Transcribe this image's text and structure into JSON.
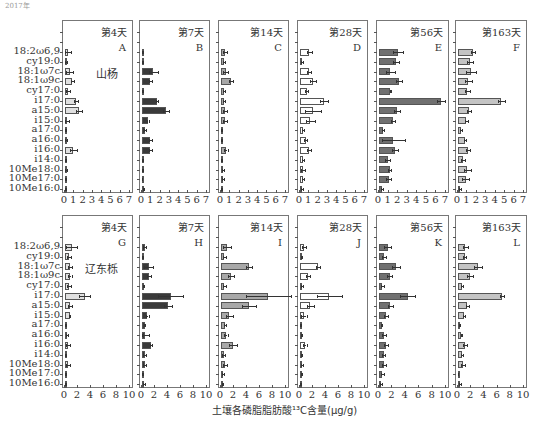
{
  "corner_text": "2017年",
  "chart_data": {
    "type": "bar",
    "orientation": "horizontal",
    "xlabel": "土壤各磷脂脂肪酸¹³C含量(μg/g)",
    "categories": [
      "18:2ω6,9",
      "cy19:0",
      "18:1ω7c",
      "18:1ω9c",
      "cy17:0",
      "i17:0",
      "a15:0",
      "i15:0",
      "a17:0",
      "a16:0",
      "i16:0",
      "i14:0",
      "10Me18:0",
      "10Me17:0",
      "10Me16:0"
    ],
    "rows": [
      {
        "species": "山杨",
        "xlim": [
          0,
          7
        ],
        "xticks": [
          "0",
          "1",
          "2",
          "3",
          "4",
          "5",
          "6",
          "7"
        ],
        "panels": [
          {
            "letter": "A",
            "title": "第4天",
            "color": "#e0e0e0",
            "values": [
              0.3,
              0.1,
              0.5,
              0.8,
              0.3,
              1.2,
              1.5,
              0.2,
              0.1,
              0.1,
              0.9,
              0.05,
              0.1,
              0.05,
              0.1
            ],
            "errors": [
              0.3,
              0.1,
              0.4,
              0.2,
              0.2,
              0.2,
              0.3,
              0.2,
              0.05,
              0.1,
              0.4,
              0.05,
              0.1,
              0.02,
              0.05
            ]
          },
          {
            "letter": "B",
            "title": "第7天",
            "color": "#3a3a3a",
            "values": [
              0.1,
              0.05,
              1.2,
              0.9,
              0.05,
              1.6,
              2.6,
              0.6,
              0.3,
              0.9,
              0.9,
              0.05,
              0.05,
              0.02,
              0.2
            ],
            "errors": [
              0.05,
              0.02,
              0.5,
              0.2,
              0.02,
              0.1,
              0.3,
              0.1,
              0.1,
              0.2,
              0.2,
              0.02,
              0.02,
              0.01,
              0.05
            ]
          },
          {
            "letter": "C",
            "title": "第14天",
            "color": "#a8a8a8",
            "values": [
              0.4,
              0.3,
              0.5,
              1.1,
              0.3,
              0.3,
              0.4,
              0.4,
              0.1,
              0.05,
              0.5,
              0.1,
              0.2,
              0.2,
              0.1
            ],
            "errors": [
              0.2,
              0.1,
              0.3,
              0.2,
              0.1,
              0.1,
              0.2,
              0.2,
              0.05,
              0.05,
              0.2,
              0.05,
              0.1,
              0.1,
              0.05
            ]
          },
          {
            "letter": "D",
            "title": "第28天",
            "color": "#ffffff",
            "values": [
              1.0,
              0.2,
              1.0,
              1.4,
              0.7,
              2.6,
              1.4,
              1.1,
              0.3,
              0.6,
              1.0,
              0.3,
              0.3,
              0.3,
              0.2
            ],
            "errors": [
              0.3,
              0.1,
              0.2,
              0.3,
              0.2,
              0.4,
              0.9,
              0.5,
              0.1,
              0.2,
              0.2,
              0.1,
              0.2,
              0.1,
              0.1
            ]
          },
          {
            "letter": "E",
            "title": "第56天",
            "color": "#707070",
            "values": [
              2.0,
              1.8,
              1.2,
              2.1,
              1.2,
              6.5,
              1.9,
              1.5,
              0.4,
              1.5,
              1.7,
              0.9,
              1.1,
              1.0,
              0.3
            ],
            "errors": [
              0.5,
              0.3,
              0.5,
              0.3,
              0.1,
              0.4,
              0.3,
              0.2,
              0.1,
              1.2,
              0.3,
              0.3,
              0.2,
              0.3,
              0.1
            ]
          },
          {
            "letter": "F",
            "title": "第163天",
            "color": "#c4c4c4",
            "values": [
              1.6,
              1.3,
              1.4,
              1.1,
              1.0,
              4.6,
              1.2,
              0.9,
              0.3,
              0.7,
              1.1,
              0.5,
              1.0,
              0.8,
              0.2
            ],
            "errors": [
              0.2,
              0.3,
              0.5,
              0.4,
              0.3,
              0.4,
              0.2,
              0.2,
              0.1,
              0.1,
              0.2,
              0.2,
              0.4,
              0.4,
              0.1
            ]
          }
        ]
      },
      {
        "species": "辽东栎",
        "xlim": [
          0,
          10
        ],
        "xticks": [
          "0",
          "2",
          "4",
          "6",
          "8",
          "10"
        ],
        "panels": [
          {
            "letter": "G",
            "title": "第4天",
            "color": "#e0e0e0",
            "values": [
              1.0,
              0.6,
              0.8,
              0.7,
              0.6,
              3.0,
              0.8,
              0.7,
              0.05,
              0.3,
              0.5,
              0.1,
              0.5,
              0.1,
              0.1
            ],
            "errors": [
              0.8,
              0.3,
              0.3,
              0.3,
              0.3,
              0.8,
              0.3,
              0.1,
              0.05,
              0.1,
              0.3,
              0.05,
              0.3,
              0.05,
              0.05
            ]
          },
          {
            "letter": "H",
            "title": "第7天",
            "color": "#3a3a3a",
            "values": [
              0.4,
              0.1,
              1.0,
              1.1,
              0.2,
              4.4,
              4.0,
              0.8,
              0.4,
              0.4,
              1.4,
              0.4,
              0.4,
              0.1,
              0.3
            ],
            "errors": [
              0.2,
              0.05,
              0.7,
              0.3,
              0.1,
              1.9,
              0.6,
              0.2,
              0.1,
              0.6,
              0.2,
              0.2,
              0.2,
              0.05,
              0.1
            ]
          },
          {
            "letter": "I",
            "title": "第14天",
            "color": "#a8a8a8",
            "values": [
              0.9,
              0.5,
              4.3,
              1.5,
              0.5,
              7.3,
              4.3,
              1.3,
              0.6,
              0.7,
              1.9,
              0.4,
              0.6,
              0.3,
              0.2
            ],
            "errors": [
              0.6,
              0.2,
              0.4,
              0.5,
              0.2,
              3.4,
              1.1,
              0.5,
              0.2,
              0.3,
              0.6,
              0.2,
              0.3,
              0.2,
              0.1
            ]
          },
          {
            "letter": "J",
            "title": "第28天",
            "color": "#ffffff",
            "values": [
              0.6,
              0.2,
              2.8,
              1.2,
              0.3,
              4.5,
              1.6,
              0.6,
              0.1,
              0.2,
              0.7,
              0.2,
              0.3,
              0.2,
              0.1
            ],
            "errors": [
              0.3,
              0.1,
              0.3,
              0.3,
              0.1,
              1.9,
              0.5,
              0.4,
              0.1,
              0.1,
              0.3,
              0.1,
              0.1,
              0.1,
              0.05
            ]
          },
          {
            "letter": "K",
            "title": "第56天",
            "color": "#707070",
            "values": [
              1.3,
              0.8,
              2.6,
              1.6,
              0.5,
              4.3,
              1.7,
              1.0,
              0.4,
              0.7,
              1.1,
              0.7,
              0.8,
              0.5,
              0.3
            ],
            "errors": [
              0.5,
              0.3,
              0.6,
              0.4,
              0.2,
              1.1,
              0.4,
              0.3,
              0.1,
              0.3,
              0.3,
              0.2,
              0.3,
              0.2,
              0.1
            ]
          },
          {
            "letter": "L",
            "title": "第163天",
            "color": "#c4c4c4",
            "values": [
              1.1,
              1.0,
              3.0,
              1.8,
              0.6,
              6.6,
              1.4,
              0.9,
              0.2,
              0.5,
              1.0,
              0.6,
              0.8,
              0.05,
              0.3
            ],
            "errors": [
              0.4,
              0.2,
              0.6,
              0.5,
              0.2,
              0.3,
              0.2,
              0.2,
              0.1,
              0.1,
              0.3,
              0.2,
              0.3,
              0.02,
              0.1
            ]
          }
        ]
      }
    ]
  }
}
